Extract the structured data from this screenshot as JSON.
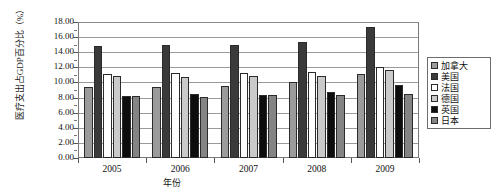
{
  "chart_data": {
    "type": "bar",
    "title": "",
    "ylabel": "医疗支出占GDP百分比（%）",
    "xlabel": "年份",
    "categories": [
      "2005",
      "2006",
      "2007",
      "2008",
      "2009"
    ],
    "ylim": [
      0,
      18
    ],
    "ytick_step": 2,
    "ytick_labels": [
      "18.00",
      "16.00",
      "14.00",
      "12.00",
      "10.00",
      "8.00",
      "6.00",
      "4.00",
      "2.00",
      "0.00"
    ],
    "ytick_values": [
      18,
      16,
      14,
      12,
      10,
      8,
      6,
      4,
      2,
      0
    ],
    "grid": true,
    "legend_position": "right",
    "series": [
      {
        "name": "加拿大",
        "color": "#9b9b9b",
        "values": [
          9.4,
          9.4,
          9.5,
          10.0,
          11.1
        ]
      },
      {
        "name": "美国",
        "color": "#3a3a3a",
        "values": [
          14.8,
          14.9,
          15.0,
          15.4,
          17.3
        ]
      },
      {
        "name": "法国",
        "color": "#ffffff",
        "values": [
          11.1,
          11.2,
          11.3,
          11.4,
          12.0
        ]
      },
      {
        "name": "德国",
        "color": "#cacaca",
        "values": [
          10.8,
          10.7,
          10.9,
          10.8,
          11.6
        ]
      },
      {
        "name": "英国",
        "color": "#0d0d0d",
        "values": [
          8.2,
          8.5,
          8.4,
          8.8,
          9.6
        ]
      },
      {
        "name": "日本",
        "color": "#848484",
        "values": [
          8.2,
          8.1,
          8.3,
          8.4,
          8.5
        ]
      }
    ]
  }
}
